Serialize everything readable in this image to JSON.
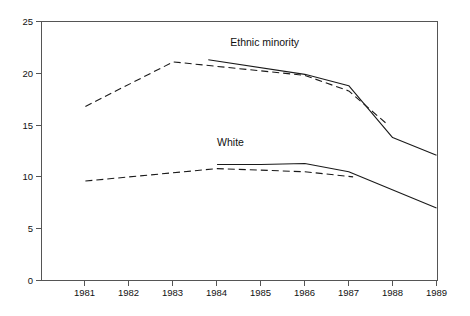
{
  "chart_data": {
    "type": "line",
    "title": "",
    "xlabel": "",
    "ylabel": "",
    "xlim": [
      1980,
      1989
    ],
    "ylim": [
      0,
      25
    ],
    "grid": false,
    "legend_position": "inline-annotations",
    "x_tick_labels": [
      "1981",
      "1982",
      "1983",
      "1984",
      "1985",
      "1986",
      "1987",
      "1988",
      "1989"
    ],
    "x_ticks": [
      1981,
      1982,
      1983,
      1984,
      1985,
      1986,
      1987,
      1988,
      1989
    ],
    "y_tick_labels": [
      "0",
      "5",
      "10",
      "15",
      "20",
      "25"
    ],
    "y_ticks": [
      0,
      5,
      10,
      15,
      20,
      25
    ],
    "annotations": [
      {
        "text": "Ethnic minority",
        "x": 1984.3,
        "y": 22.6
      },
      {
        "text": "White",
        "x": 1984.0,
        "y": 13.0
      }
    ],
    "series": [
      {
        "name": "Ethnic minority (projected)",
        "group": "Ethnic minority",
        "style": "dashed",
        "x": [
          1981,
          1983,
          1986,
          1987,
          1987.9
        ],
        "values": [
          16.8,
          21.1,
          19.8,
          18.3,
          15.0
        ]
      },
      {
        "name": "Ethnic minority (actual)",
        "group": "Ethnic minority",
        "style": "solid",
        "x": [
          1983.8,
          1986,
          1987,
          1988,
          1989
        ],
        "values": [
          21.3,
          19.9,
          18.8,
          13.8,
          12.1
        ]
      },
      {
        "name": "White (projected)",
        "group": "White",
        "style": "dashed",
        "x": [
          1981,
          1984,
          1986,
          1987.1
        ],
        "values": [
          9.6,
          10.8,
          10.5,
          10.0
        ]
      },
      {
        "name": "White (actual)",
        "group": "White",
        "style": "solid",
        "x": [
          1984,
          1985,
          1986,
          1987,
          1989
        ],
        "values": [
          11.2,
          11.2,
          11.3,
          10.5,
          7.0
        ]
      }
    ]
  },
  "axes": {
    "y_axis_name": "y-axis",
    "x_axis_name": "x-axis"
  }
}
